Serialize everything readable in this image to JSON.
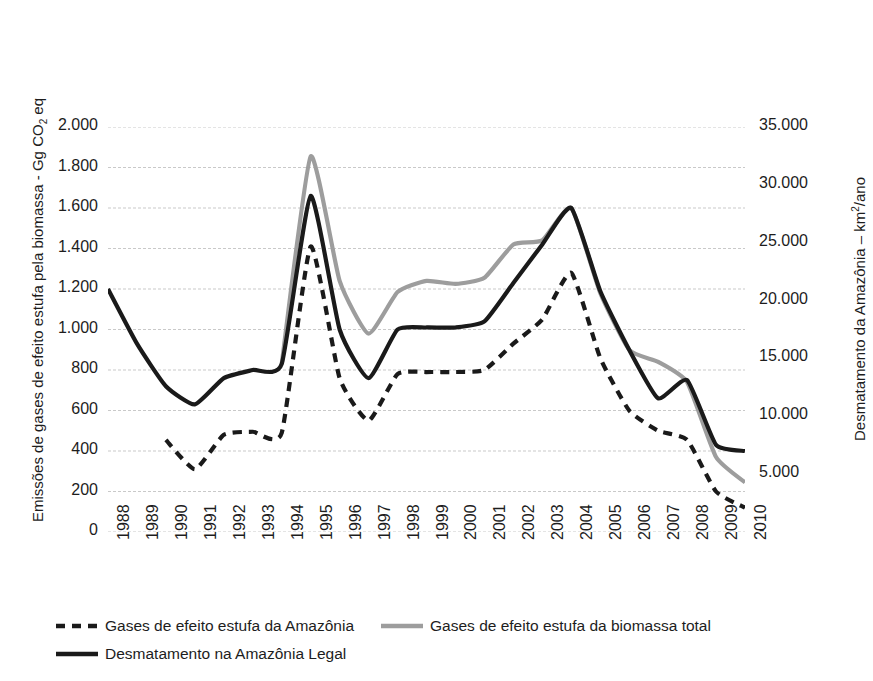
{
  "chart_data": {
    "type": "line",
    "title": "",
    "x": [
      1988,
      1989,
      1990,
      1991,
      1992,
      1993,
      1994,
      1995,
      1996,
      1997,
      1998,
      1999,
      2000,
      2001,
      2002,
      2003,
      2004,
      2005,
      2006,
      2007,
      2008,
      2009,
      2010
    ],
    "xlabel": "",
    "ylabel": "Emissões de gases de efeito estufa pela biomassa - Gg CO2 eq",
    "ylabel_right": "Desmatamento da Amazônia – km²/ano",
    "ylim": [
      0,
      2000
    ],
    "ylim_right": [
      0,
      35000
    ],
    "yticks": [
      "0",
      "200",
      "400",
      "600",
      "800",
      "1.000",
      "1.200",
      "1.400",
      "1.600",
      "1.800",
      "2.000"
    ],
    "yticks_right": [
      "-",
      "5.000",
      "10.000",
      "15.000",
      "20.000",
      "25.000",
      "30.000",
      "35.000"
    ],
    "xticks": [
      "1988",
      "1989",
      "1990",
      "1991",
      "1992",
      "1993",
      "1994",
      "1995",
      "1996",
      "1997",
      "1998",
      "1999",
      "2000",
      "2001",
      "2002",
      "2003",
      "2004",
      "2005",
      "2006",
      "2007",
      "2008",
      "2009",
      "2010"
    ],
    "grid": true,
    "grid_color": "#c9c9c9",
    "legend_position": "bottom",
    "series": [
      {
        "name": "Gases de efeito estufa da Amazônia",
        "style": "dashed",
        "color": "#1a1a1a",
        "axis": "left",
        "x": [
          1990,
          1991,
          1992,
          1993,
          1994,
          1995,
          1996,
          1997,
          1998,
          1999,
          2000,
          2001,
          2002,
          2003,
          2004,
          2005,
          2006,
          2007,
          2008,
          2009,
          2010
        ],
        "values": [
          455,
          310,
          480,
          495,
          490,
          1410,
          760,
          550,
          780,
          790,
          790,
          800,
          930,
          1050,
          1280,
          860,
          600,
          500,
          455,
          200,
          120
        ]
      },
      {
        "name": "Gases de efeito estufa da biomassa total",
        "style": "solid",
        "color": "#9d9d9d",
        "axis": "left",
        "x": [
          1994,
          1995,
          1996,
          1997,
          1998,
          1999,
          2000,
          2001,
          2002,
          2003,
          2004,
          2005,
          2006,
          2007,
          2008,
          2009,
          2010
        ],
        "values": [
          830,
          1855,
          1240,
          980,
          1185,
          1240,
          1225,
          1255,
          1420,
          1440,
          1600,
          1180,
          900,
          840,
          740,
          370,
          245
        ]
      },
      {
        "name": "Desmatamento na Amazônia Legal",
        "style": "solid",
        "color": "#1a1a1a",
        "axis": "right",
        "x": [
          1988,
          1989,
          1990,
          1991,
          1992,
          1993,
          1994,
          1995,
          1996,
          1997,
          1998,
          1999,
          2000,
          2001,
          2002,
          2003,
          2004,
          2005,
          2006,
          2007,
          2008,
          2009,
          2010
        ],
        "values": [
          1200,
          930,
          720,
          630,
          760,
          800,
          830,
          1660,
          1000,
          760,
          1000,
          1010,
          1010,
          1040,
          1230,
          1420,
          1600,
          1190,
          900,
          660,
          750,
          430,
          400
        ]
      }
    ]
  },
  "legend": {
    "items": [
      {
        "label": "Gases de efeito estufa da Amazônia",
        "style": "dashed",
        "color": "#1a1a1a"
      },
      {
        "label": "Gases de efeito estufa da biomassa total",
        "style": "solid",
        "color": "#9d9d9d"
      },
      {
        "label": "Desmatamento na Amazônia Legal",
        "style": "solid",
        "color": "#1a1a1a"
      }
    ]
  }
}
